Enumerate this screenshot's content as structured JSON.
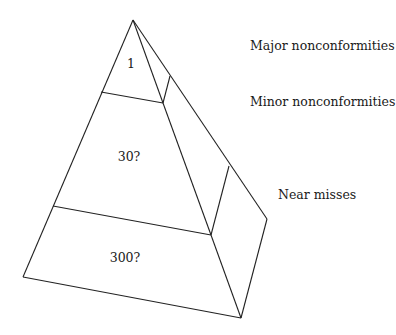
{
  "diagram": {
    "type": "pyramid",
    "tiers": [
      {
        "name": "Major nonconformities",
        "value": "1"
      },
      {
        "name": "Minor nonconformities",
        "value": "30?"
      },
      {
        "name": "Near misses",
        "value": "300?"
      }
    ],
    "colors": {
      "line": "#222222",
      "text": "#1a1a1a",
      "background": "#ffffff"
    }
  }
}
